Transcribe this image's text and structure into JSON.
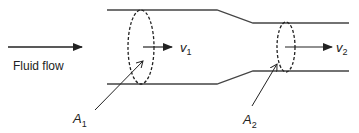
{
  "diagram": {
    "type": "fluid-continuity-pipe",
    "flow_label": "Fluid flow",
    "sections": [
      {
        "area_symbol": "A",
        "area_subscript": "1",
        "velocity_symbol": "v",
        "velocity_subscript": "1"
      },
      {
        "area_symbol": "A",
        "area_subscript": "2",
        "velocity_symbol": "v",
        "velocity_subscript": "2"
      }
    ],
    "colors": {
      "line": "#333333",
      "text": "#222222",
      "background": "#ffffff"
    }
  }
}
